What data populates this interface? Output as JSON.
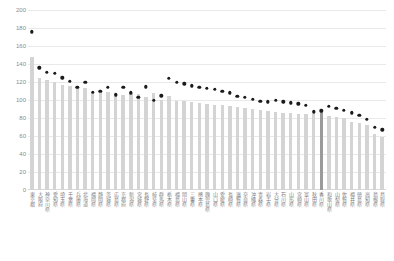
{
  "chart_data": {
    "type": "bar",
    "title": "",
    "subtitle": "",
    "xlabel": "",
    "ylabel": "",
    "ylim": [
      0,
      200
    ],
    "ytick_step": 20,
    "yticks": [
      0,
      20,
      40,
      60,
      80,
      100,
      120,
      140,
      160,
      180,
      200
    ],
    "ytick_labels": [
      "0",
      "20",
      "40",
      "60",
      "80",
      "100",
      "120",
      "140",
      "160",
      "180",
      "200"
    ],
    "grid": true,
    "legend": "none",
    "categories": [
      "東京都",
      "大阪府",
      "神奈川県",
      "愛知県",
      "埼玉県",
      "千葉県",
      "兵庫県",
      "北海道",
      "福岡県",
      "静岡県",
      "茨城県",
      "広島県",
      "京都府",
      "新潟県",
      "宮城県",
      "長野県",
      "岐阜県",
      "群馬県",
      "栃木県",
      "福島県",
      "岡山県",
      "三重県",
      "熊本県",
      "鹿児島県",
      "山口県",
      "愛媛県",
      "長崎県",
      "滋賀県",
      "奈良県",
      "沖縄県",
      "青森県",
      "岩手県",
      "大分県",
      "石川県",
      "山形県",
      "宮崎県",
      "富山県",
      "秋田県",
      "香川県",
      "和歌山県",
      "山梨県",
      "佐賀県",
      "福井県",
      "徳島県",
      "高知県",
      "島根県",
      "鳥取県"
    ],
    "series": [
      {
        "name": "bars",
        "kind": "bar",
        "color": "#d4d4d4",
        "highlight_index": 38,
        "highlight_color": "#9a9a9a",
        "values": [
          148,
          124,
          122,
          120,
          117,
          116,
          114,
          113,
          109,
          110,
          109,
          108,
          106,
          108,
          107,
          103,
          108,
          100,
          104,
          99,
          99,
          98,
          97,
          96,
          95,
          94,
          93,
          92,
          91,
          90,
          89,
          88,
          87,
          86,
          86,
          85,
          84,
          84,
          88,
          82,
          81,
          80,
          76,
          74,
          72,
          62,
          59
        ]
      },
      {
        "name": "markers",
        "kind": "scatter",
        "color": "#1b1b1b",
        "values": [
          176,
          136,
          131,
          130,
          125,
          121,
          114,
          120,
          109,
          110,
          114,
          106,
          114,
          108,
          103,
          115,
          100,
          105,
          124,
          120,
          118,
          116,
          114,
          113,
          112,
          110,
          108,
          104,
          103,
          101,
          99,
          98,
          100,
          98,
          97,
          96,
          94,
          87,
          88,
          93,
          91,
          89,
          86,
          83,
          79,
          70,
          67
        ]
      }
    ]
  }
}
